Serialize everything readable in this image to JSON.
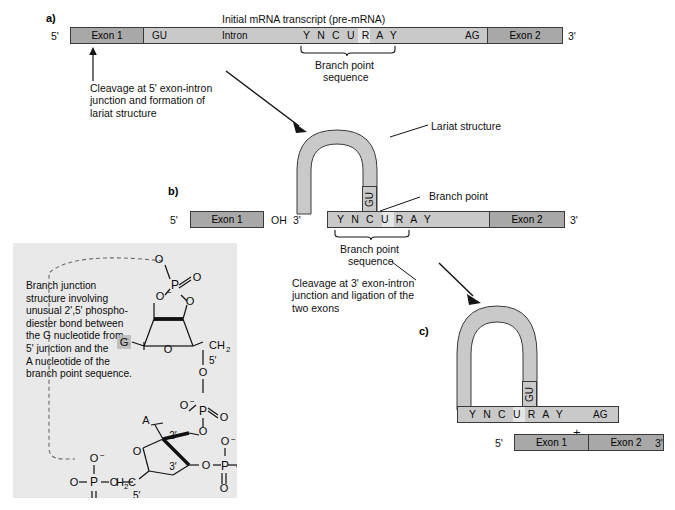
{
  "figure": {
    "panels": {
      "a": "a)",
      "b": "b)",
      "c": "c)"
    }
  },
  "panel_a": {
    "title": "Initial mRNA transcript (pre-mRNA)",
    "five_prime": "5'",
    "three_prime": "3'",
    "segments": {
      "exon1": "Exon 1",
      "gu": "GU",
      "intron": "Intron",
      "branch_point_sequence": "Y N C U R A Y",
      "ag": "AG",
      "exon2": "Exon 2"
    },
    "brace_label_line1": "Branch point",
    "brace_label_line2": "sequence",
    "step_caption": "Cleavage at 5' exon-intron\njunction and formation of\nlariat structure"
  },
  "panel_b": {
    "five_prime": "5'",
    "three_prime": "3'",
    "exon1": "Exon 1",
    "oh": "OH",
    "exon2": "Exon 2",
    "gu": "GU",
    "branch_point_sequence": "Y N C U R A Y",
    "lariat_label": "Lariat structure",
    "branch_point_label": "Branch point",
    "brace_label_line1": "Branch point",
    "brace_label_line2": "sequence",
    "step_caption": "Cleavage at 3' exon-intron\njunction and ligation of the\ntwo exons"
  },
  "panel_c": {
    "gu": "GU",
    "branch_point_sequence": "Y N C U R A Y",
    "ag": "AG",
    "plus": "+",
    "five_prime": "5'",
    "three_prime": "3'",
    "exon1": "Exon 1",
    "exon2": "Exon 2"
  },
  "inset": {
    "caption": "Branch junction\nstructure involving\nunusual 2',5' phospho-\ndiester bond between\nthe G nucleotide from\n5' junction and the\nA nucleotide of the\nbranch point sequence.",
    "atoms": {
      "g_base": "G",
      "a_base": "A",
      "phosphorus": "P",
      "oxygen": "O",
      "oxygen_minus": "O",
      "minus": "−",
      "ch2": "CH",
      "ch2_sub": "2",
      "h2c": "H",
      "h2c_sub": "2",
      "h2c_c": "C",
      "five_prime": "5'",
      "two_prime": "2'",
      "three_prime": "3'",
      "ellipsis": "···"
    }
  },
  "colors": {
    "intron_fill": "#c9c9c9",
    "exon_fill": "#a8a8a8",
    "stroke": "#3a3a3a",
    "inset_bg": "#e9e9e9",
    "highlight": "#e6e6e6",
    "text": "#101010"
  }
}
